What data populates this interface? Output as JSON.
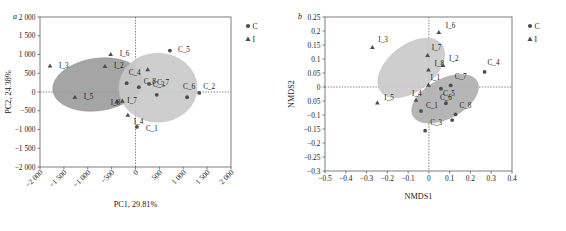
{
  "figure": {
    "panels": [
      {
        "letter": "a",
        "id": "pca"
      },
      {
        "letter": "b",
        "id": "nmds"
      }
    ]
  },
  "legend": {
    "group_c_label": "C",
    "group_i_label": "I",
    "c_marker": "circle-marker",
    "i_marker": "triangle-marker",
    "position": "right"
  },
  "colors": {
    "ellipse_dark": "#9d9d9d",
    "ellipse_light": "#c9c9c9",
    "ellipse_mid": "#b0b0b0",
    "marker": "#4d4d4d",
    "axis": "#5d5d5d",
    "text": "#1a1a1a"
  },
  "chart_data": [
    {
      "type": "scatter",
      "id": "pca",
      "panel_letter": "a",
      "title": "",
      "xlabel": "PC1,  29.81%",
      "ylabel": "PC2,  24.38%",
      "xlim": [
        -2000,
        2000
      ],
      "ylim": [
        -2000,
        2000
      ],
      "xticks": [
        -2000,
        -1500,
        -1000,
        -500,
        0,
        500,
        1000,
        1500,
        2000
      ],
      "xtick_labels": [
        "−2 000",
        "−1 500",
        "−1 000",
        "−500",
        "0",
        "500",
        "1 000",
        "1 500",
        "2 000"
      ],
      "yticks": [
        -2000,
        -1500,
        -1000,
        -500,
        0,
        500,
        1000,
        1500,
        2000
      ],
      "ytick_labels": [
        "−2 000",
        "−1 500",
        "−1 000",
        "−500",
        "0",
        "500",
        "1 000",
        "1 500",
        "2 000"
      ],
      "xtick_rotation": 45,
      "grid": false,
      "zero_lines": true,
      "series": [
        {
          "name": "I",
          "marker": "triangle",
          "points": [
            {
              "label": "I_3",
              "x": -1790,
              "y": 700,
              "label_dx": 9,
              "label_dy": 2
            },
            {
              "label": "I_2",
              "x": -640,
              "y": 690,
              "label_dx": 9,
              "label_dy": 2
            },
            {
              "label": "I_6",
              "x": -520,
              "y": 1010,
              "label_dx": 9,
              "label_dy": 2
            },
            {
              "label": "I_5",
              "x": -1270,
              "y": -130,
              "label_dx": 9,
              "label_dy": 2
            },
            {
              "label": "I_8",
              "x": -395,
              "y": -255,
              "label_dx": -6,
              "label_dy": 3
            },
            {
              "label": "I_7",
              "x": -275,
              "y": -235,
              "label_dx": 5,
              "label_dy": 2
            },
            {
              "label": "I_4",
              "x": -160,
              "y": -610,
              "label_dx": 6,
              "label_dy": 9
            },
            {
              "label": "I_1",
              "x": 255,
              "y": 600,
              "label_dx": 0,
              "label_dy": 0
            }
          ]
        },
        {
          "name": "C",
          "marker": "circle",
          "points": [
            {
              "label": "C_5",
              "x": 720,
              "y": 1105,
              "label_dx": 8,
              "label_dy": 1
            },
            {
              "label": "C_4",
              "x": -185,
              "y": 235,
              "label_dx": 2,
              "label_dy": -8
            },
            {
              "label": "C_8",
              "x": 70,
              "y": 130,
              "label_dx": 5,
              "label_dy": -3
            },
            {
              "label": "C_7",
              "x": 285,
              "y": 215,
              "label_dx": 8,
              "label_dy": 1
            },
            {
              "label": "C_3",
              "x": 445,
              "y": -75,
              "label_dx": -4,
              "label_dy": -8
            },
            {
              "label": "C_6",
              "x": 1080,
              "y": -140,
              "label_dx": -4,
              "label_dy": -8
            },
            {
              "label": "C_2",
              "x": 1335,
              "y": -25,
              "label_dx": 4,
              "label_dy": -4
            },
            {
              "label": "C_1",
              "x": 30,
              "y": -930,
              "label_dx": 9,
              "label_dy": 4
            }
          ]
        }
      ],
      "ellipses": [
        {
          "group": "I",
          "shade": "dark",
          "cx": -790,
          "cy": 200,
          "rx": 950,
          "ry": 700,
          "rotation": -8
        },
        {
          "group": "C",
          "shade": "light",
          "cx": 470,
          "cy": 115,
          "rx": 820,
          "ry": 920,
          "rotation": 0
        }
      ]
    },
    {
      "type": "scatter",
      "id": "nmds",
      "panel_letter": "b",
      "title": "",
      "xlabel": "NMDS1",
      "ylabel": "NMDS2",
      "xlim": [
        -0.5,
        0.4
      ],
      "ylim": [
        -0.3,
        0.25
      ],
      "xticks": [
        -0.5,
        -0.4,
        -0.3,
        -0.2,
        -0.1,
        0,
        0.1,
        0.2,
        0.3,
        0.4
      ],
      "xtick_labels": [
        "−0.5",
        "−0.4",
        "−0.3",
        "−0.2",
        "−0.1",
        "0",
        "0.1",
        "0.2",
        "0.3",
        "0.4"
      ],
      "yticks": [
        -0.3,
        -0.25,
        -0.2,
        -0.15,
        -0.1,
        -0.05,
        0,
        0.05,
        0.1,
        0.15,
        0.2,
        0.25
      ],
      "ytick_labels": [
        "−0.3",
        "−0.25",
        "−0.2",
        "−0.15",
        "−0.1",
        "0.05",
        "0",
        "0.05",
        "0.1",
        "0.15",
        "0.2",
        "0.25"
      ],
      "xtick_rotation": 0,
      "grid": false,
      "zero_lines": true,
      "series": [
        {
          "name": "I",
          "marker": "triangle",
          "points": [
            {
              "label": "I_3",
              "x": -0.272,
              "y": 0.142,
              "label_dx": 6,
              "label_dy": -5
            },
            {
              "label": "I_6",
              "x": 0.048,
              "y": 0.196,
              "label_dx": 7,
              "label_dy": -4
            },
            {
              "label": "I_7",
              "x": -0.006,
              "y": 0.114,
              "label_dx": 4,
              "label_dy": -5
            },
            {
              "label": "I_8",
              "x": -0.002,
              "y": 0.062,
              "label_dx": 6,
              "label_dy": -4
            },
            {
              "label": "I_2",
              "x": 0.068,
              "y": 0.078,
              "label_dx": 6,
              "label_dy": -4
            },
            {
              "label": "I_1",
              "x": -0.002,
              "y": 0.008,
              "label_dx": 2,
              "label_dy": -5
            },
            {
              "label": "I_5",
              "x": -0.248,
              "y": -0.056,
              "label_dx": 7,
              "label_dy": -3
            },
            {
              "label": "I_4",
              "x": -0.062,
              "y": -0.046,
              "label_dx": -4,
              "label_dy": -4
            }
          ]
        },
        {
          "name": "C",
          "marker": "circle",
          "points": [
            {
              "label": "C_4",
              "x": 0.268,
              "y": 0.054,
              "label_dx": 3,
              "label_dy": -7
            },
            {
              "label": "C_7",
              "x": 0.105,
              "y": 0.006,
              "label_dx": 4,
              "label_dy": -6
            },
            {
              "label": "C_5",
              "x": 0.058,
              "y": -0.006,
              "label_dx": 2,
              "label_dy": 7
            },
            {
              "label": "C_6",
              "x": 0.082,
              "y": -0.058,
              "label_dx": -6,
              "label_dy": -3
            },
            {
              "label": "C_8",
              "x": 0.128,
              "y": -0.098,
              "label_dx": 4,
              "label_dy": -6
            },
            {
              "label": "C_2",
              "x": 0.112,
              "y": -0.118,
              "label_dx": 0,
              "label_dy": 0
            },
            {
              "label": "C_1",
              "x": -0.038,
              "y": -0.086,
              "label_dx": 5,
              "label_dy": -3
            },
            {
              "label": "C_3",
              "x": -0.018,
              "y": -0.156,
              "label_dx": 5,
              "label_dy": -6
            }
          ]
        }
      ],
      "ellipses": [
        {
          "group": "I",
          "shade": "light",
          "cx": -0.085,
          "cy": 0.068,
          "rx": 0.185,
          "ry": 0.082,
          "rotation": -38
        },
        {
          "group": "C",
          "shade": "mid",
          "cx": 0.078,
          "cy": -0.042,
          "rx": 0.175,
          "ry": 0.07,
          "rotation": -28
        }
      ]
    }
  ]
}
